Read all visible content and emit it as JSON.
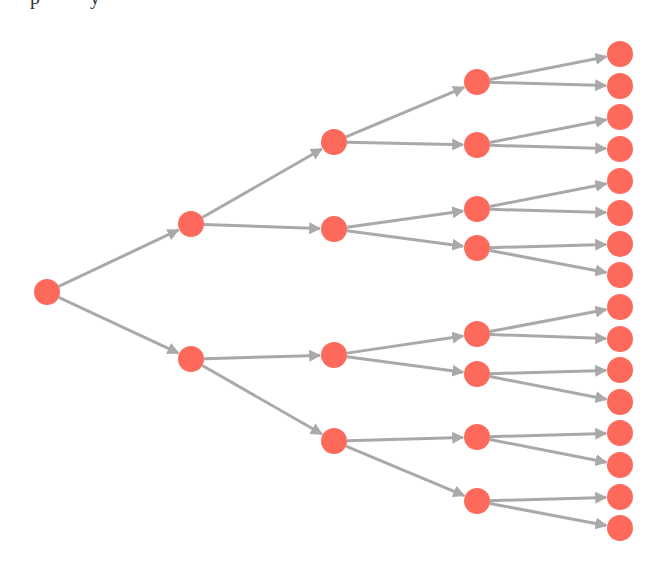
{
  "caption_fragment": "p          y",
  "colors": {
    "node": "#fd6a5c",
    "edge": "#a9a9a9",
    "background": "#ffffff"
  },
  "tree": {
    "type": "binary-tree",
    "depth": 4,
    "node_radius": 13,
    "nodes": [
      {
        "id": "n0",
        "x": 47,
        "y": 292,
        "level": 0
      },
      {
        "id": "n1",
        "x": 191,
        "y": 224,
        "level": 1
      },
      {
        "id": "n2",
        "x": 191,
        "y": 359,
        "level": 1
      },
      {
        "id": "n3",
        "x": 334,
        "y": 142,
        "level": 2
      },
      {
        "id": "n4",
        "x": 334,
        "y": 229,
        "level": 2
      },
      {
        "id": "n5",
        "x": 334,
        "y": 355,
        "level": 2
      },
      {
        "id": "n6",
        "x": 334,
        "y": 441,
        "level": 2
      },
      {
        "id": "n7",
        "x": 477,
        "y": 82,
        "level": 3
      },
      {
        "id": "n8",
        "x": 477,
        "y": 145,
        "level": 3
      },
      {
        "id": "n9",
        "x": 477,
        "y": 209,
        "level": 3
      },
      {
        "id": "n10",
        "x": 477,
        "y": 248,
        "level": 3
      },
      {
        "id": "n11",
        "x": 477,
        "y": 334,
        "level": 3
      },
      {
        "id": "n12",
        "x": 477,
        "y": 374,
        "level": 3
      },
      {
        "id": "n13",
        "x": 477,
        "y": 437,
        "level": 3
      },
      {
        "id": "n14",
        "x": 477,
        "y": 501,
        "level": 3
      },
      {
        "id": "n15",
        "x": 620,
        "y": 54,
        "level": 4
      },
      {
        "id": "n16",
        "x": 620,
        "y": 86,
        "level": 4
      },
      {
        "id": "n17",
        "x": 620,
        "y": 117,
        "level": 4
      },
      {
        "id": "n18",
        "x": 620,
        "y": 149,
        "level": 4
      },
      {
        "id": "n19",
        "x": 620,
        "y": 181,
        "level": 4
      },
      {
        "id": "n20",
        "x": 620,
        "y": 213,
        "level": 4
      },
      {
        "id": "n21",
        "x": 620,
        "y": 244,
        "level": 4
      },
      {
        "id": "n22",
        "x": 620,
        "y": 275,
        "level": 4
      },
      {
        "id": "n23",
        "x": 620,
        "y": 307,
        "level": 4
      },
      {
        "id": "n24",
        "x": 620,
        "y": 339,
        "level": 4
      },
      {
        "id": "n25",
        "x": 620,
        "y": 370,
        "level": 4
      },
      {
        "id": "n26",
        "x": 620,
        "y": 402,
        "level": 4
      },
      {
        "id": "n27",
        "x": 620,
        "y": 433,
        "level": 4
      },
      {
        "id": "n28",
        "x": 620,
        "y": 465,
        "level": 4
      },
      {
        "id": "n29",
        "x": 620,
        "y": 497,
        "level": 4
      },
      {
        "id": "n30",
        "x": 620,
        "y": 528,
        "level": 4
      }
    ],
    "edges": [
      [
        "n0",
        "n1"
      ],
      [
        "n0",
        "n2"
      ],
      [
        "n1",
        "n3"
      ],
      [
        "n1",
        "n4"
      ],
      [
        "n2",
        "n5"
      ],
      [
        "n2",
        "n6"
      ],
      [
        "n3",
        "n7"
      ],
      [
        "n3",
        "n8"
      ],
      [
        "n4",
        "n9"
      ],
      [
        "n4",
        "n10"
      ],
      [
        "n5",
        "n11"
      ],
      [
        "n5",
        "n12"
      ],
      [
        "n6",
        "n13"
      ],
      [
        "n6",
        "n14"
      ],
      [
        "n7",
        "n15"
      ],
      [
        "n7",
        "n16"
      ],
      [
        "n8",
        "n17"
      ],
      [
        "n8",
        "n18"
      ],
      [
        "n9",
        "n19"
      ],
      [
        "n9",
        "n20"
      ],
      [
        "n10",
        "n21"
      ],
      [
        "n10",
        "n22"
      ],
      [
        "n11",
        "n23"
      ],
      [
        "n11",
        "n24"
      ],
      [
        "n12",
        "n25"
      ],
      [
        "n12",
        "n26"
      ],
      [
        "n13",
        "n27"
      ],
      [
        "n13",
        "n28"
      ],
      [
        "n14",
        "n29"
      ],
      [
        "n14",
        "n30"
      ]
    ]
  }
}
